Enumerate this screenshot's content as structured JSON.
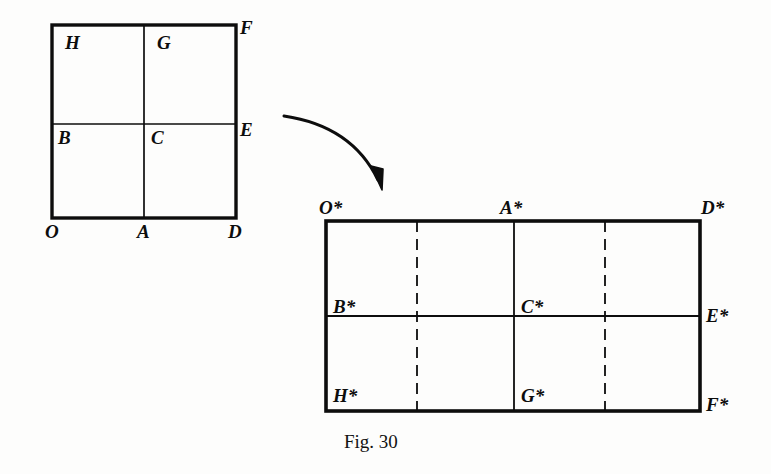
{
  "figure": {
    "caption": "Fig. 30",
    "caption_pos": {
      "x": 344,
      "y": 432
    },
    "background_color": "#fdfdfc",
    "ink_color": "#0d0d0d"
  },
  "left_shape": {
    "name": "square",
    "description": "Square O A D E F G H B divided into four quadrants by one vertical and one horizontal mid-line",
    "bounds": {
      "x": 52,
      "y": 25,
      "width": 184,
      "height": 193
    },
    "outline_stroke_width": 3.4,
    "inner_stroke_width": 1.7,
    "inner_lines": [
      {
        "type": "vertical",
        "x": 144,
        "y1": 25,
        "y2": 218,
        "style": "solid"
      },
      {
        "type": "horizontal",
        "y": 124,
        "x1": 52,
        "x2": 236,
        "style": "solid"
      }
    ],
    "labels": [
      {
        "id": "H",
        "text": "H",
        "x": 65,
        "y": 33
      },
      {
        "id": "G",
        "text": "G",
        "x": 157,
        "y": 33
      },
      {
        "id": "F",
        "text": "F",
        "x": 240,
        "y": 18
      },
      {
        "id": "B",
        "text": "B",
        "x": 58,
        "y": 128
      },
      {
        "id": "C",
        "text": "C",
        "x": 151,
        "y": 128
      },
      {
        "id": "E",
        "text": "E",
        "x": 240,
        "y": 120
      },
      {
        "id": "O",
        "text": "O",
        "x": 45,
        "y": 222
      },
      {
        "id": "A",
        "text": "A",
        "x": 137,
        "y": 222
      },
      {
        "id": "D",
        "text": "D",
        "x": 228,
        "y": 222
      }
    ]
  },
  "arrow": {
    "name": "transformation-arrow",
    "description": "Curved arrow pointing from the square to the rectangle",
    "start": {
      "x": 284,
      "y": 116
    },
    "control": {
      "x": 350,
      "y": 128
    },
    "end": {
      "x": 380,
      "y": 184
    },
    "stroke_width": 3
  },
  "right_shape": {
    "name": "rectangle",
    "description": "Rectangle O* A* D* E* F* G* H* B* divided by solid mid vertical, solid mid horizontal, and two dashed quarter verticals",
    "bounds": {
      "x": 326,
      "y": 221,
      "width": 374,
      "height": 190
    },
    "outline_stroke_width": 3.6,
    "inner_stroke_width": 1.8,
    "inner_lines": [
      {
        "type": "vertical",
        "x": 417,
        "y1": 221,
        "y2": 411,
        "style": "dashed"
      },
      {
        "type": "vertical",
        "x": 514,
        "y1": 221,
        "y2": 411,
        "style": "solid"
      },
      {
        "type": "vertical",
        "x": 605,
        "y1": 221,
        "y2": 411,
        "style": "dashed"
      },
      {
        "type": "horizontal",
        "y": 316,
        "x1": 326,
        "x2": 700,
        "style": "solid"
      }
    ],
    "dash_pattern": "11 7",
    "labels": [
      {
        "id": "O-star",
        "text": "O*",
        "x": 319,
        "y": 198
      },
      {
        "id": "A-star",
        "text": "A*",
        "x": 500,
        "y": 198
      },
      {
        "id": "D-star",
        "text": "D*",
        "x": 701,
        "y": 198
      },
      {
        "id": "B-star",
        "text": "B*",
        "x": 333,
        "y": 297
      },
      {
        "id": "C-star",
        "text": "C*",
        "x": 521,
        "y": 297
      },
      {
        "id": "E-star",
        "text": "E*",
        "x": 706,
        "y": 306
      },
      {
        "id": "H-star",
        "text": "H*",
        "x": 333,
        "y": 386
      },
      {
        "id": "G-star",
        "text": "G*",
        "x": 521,
        "y": 386
      },
      {
        "id": "F-star",
        "text": "F*",
        "x": 706,
        "y": 395
      }
    ]
  }
}
